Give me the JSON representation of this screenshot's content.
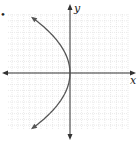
{
  "chart_data": {
    "type": "line",
    "title": "",
    "xlabel": "x",
    "ylabel": "y",
    "xlim": [
      -11,
      10
    ],
    "ylim": [
      -10,
      11
    ],
    "grid": true,
    "grid_step": 1,
    "series": [
      {
        "name": "sideways parabola x = -y^2/14 (approx.)",
        "equation": "x = -y^2/14",
        "vertex": [
          0,
          0
        ],
        "opens": "left",
        "endpoints_arrows": [
          [
            -6.5,
            9.5
          ],
          [
            -6.5,
            -9.5
          ]
        ],
        "y_range": [
          -9.5,
          9.5
        ]
      }
    ],
    "marker_dot": "•"
  }
}
